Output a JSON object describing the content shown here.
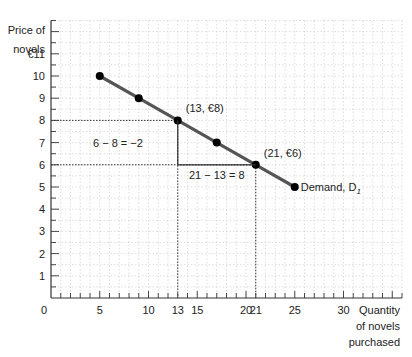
{
  "chart_data": {
    "type": "line",
    "title": "",
    "xlabel": "Quantity of novels purchased",
    "ylabel": "Price of novels",
    "xlabel_lines": [
      "Quantity",
      "of novels",
      "purchased"
    ],
    "ylabel_lines": [
      "Price of",
      "novels"
    ],
    "xlim": [
      0,
      36
    ],
    "ylim": [
      0,
      12.5
    ],
    "x_ticks": [
      0,
      5,
      10,
      13,
      15,
      20,
      21,
      25,
      30
    ],
    "x_tick_labels": [
      "0",
      "5",
      "10",
      "13",
      "15",
      "20",
      "21",
      "25",
      "30"
    ],
    "y_ticks": [
      1,
      2,
      3,
      4,
      5,
      6,
      7,
      8,
      9,
      10,
      11
    ],
    "y_tick_labels": [
      "1",
      "2",
      "3",
      "4",
      "5",
      "6",
      "7",
      "8",
      "9",
      "10",
      "€11"
    ],
    "grid": true,
    "series": [
      {
        "name": "Demand, D1",
        "x": [
          5,
          9,
          13,
          17,
          21,
          25
        ],
        "y": [
          10,
          9,
          8,
          7,
          6,
          5
        ],
        "color": "#555555"
      }
    ],
    "annotations": [
      {
        "text": "(13, €8)",
        "x": 13,
        "y": 8
      },
      {
        "text": "(21, €6)",
        "x": 21,
        "y": 6
      },
      {
        "text": "6 − 8 = −2",
        "type": "rise"
      },
      {
        "text": "21 − 13 = 8",
        "type": "run"
      },
      {
        "text": "Demand, D",
        "subscript": "1",
        "x": 25,
        "y": 5
      }
    ],
    "guides": [
      {
        "from": [
          0,
          8
        ],
        "to": [
          13,
          8
        ],
        "style": "dotted"
      },
      {
        "from": [
          13,
          8
        ],
        "to": [
          13,
          0
        ],
        "style": "dotted"
      },
      {
        "from": [
          0,
          6
        ],
        "to": [
          21,
          6
        ],
        "style": "dotted"
      },
      {
        "from": [
          21,
          6
        ],
        "to": [
          21,
          0
        ],
        "style": "dotted"
      }
    ],
    "slope_triangle": {
      "vertices": [
        [
          13,
          8
        ],
        [
          13,
          6
        ],
        [
          21,
          6
        ]
      ]
    }
  }
}
